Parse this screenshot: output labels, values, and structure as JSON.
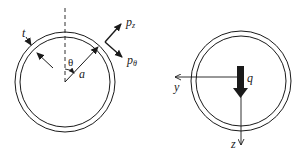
{
  "figure": {
    "left_panel": {
      "description": "Cross-section of thin-walled circular tube with wall thickness and surface pressures",
      "labels": {
        "thickness": "t",
        "angle": "θ",
        "radius": "a",
        "pressure_z_base": "p",
        "pressure_z_sub": "z",
        "pressure_theta_base": "p",
        "pressure_theta_sub": "θ"
      }
    },
    "right_panel": {
      "description": "Cross-section of tube with distributed load and coordinate axes",
      "labels": {
        "load": "q",
        "y_axis": "y",
        "z_axis": "z"
      }
    },
    "colors": {
      "stroke": "#1a1a1a",
      "background": "#ffffff"
    }
  }
}
